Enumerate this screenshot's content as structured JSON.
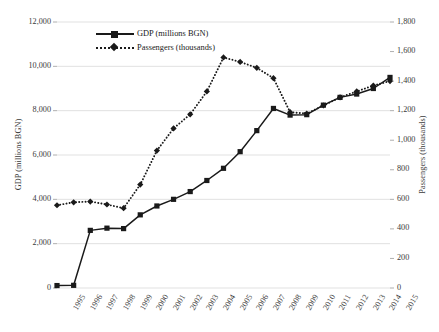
{
  "chart_data": {
    "type": "line",
    "title": "",
    "xlabel": "",
    "categories": [
      "1995",
      "1996",
      "1997",
      "1998",
      "1999",
      "2000",
      "2001",
      "2002",
      "2003",
      "2004",
      "2005",
      "2006",
      "2007",
      "2008",
      "2009",
      "2010",
      "2011",
      "2012",
      "2013",
      "2014",
      "2015"
    ],
    "grid": true,
    "legend_position": "top-center",
    "series": [
      {
        "name": "GDP (millions BGN)",
        "axis": "left",
        "marker": "square",
        "line_style": "solid",
        "color": "#1a1a1a",
        "values": [
          110,
          120,
          2600,
          2700,
          2680,
          3300,
          3700,
          4000,
          4350,
          4850,
          5400,
          6150,
          7100,
          8100,
          7800,
          7820,
          8250,
          8600,
          8750,
          9000,
          9500
        ]
      },
      {
        "name": "Passengers (thousands)",
        "axis": "right",
        "marker": "diamond",
        "line_style": "dotted",
        "color": "#1a1a1a",
        "values": [
          560,
          580,
          585,
          565,
          540,
          700,
          930,
          1080,
          1175,
          1330,
          1560,
          1530,
          1490,
          1420,
          1190,
          1180,
          1235,
          1290,
          1330,
          1370,
          1400
        ]
      }
    ],
    "y_left": {
      "label": "GDP (millions BGN)",
      "min": 0,
      "max": 12000,
      "step": 2000,
      "ticks": [
        "0",
        "2,000",
        "4,000",
        "6,000",
        "8,000",
        "10,000",
        "12,000"
      ]
    },
    "y_right": {
      "label": "Passengers (thousands)",
      "min": 0,
      "max": 1800,
      "step": 200,
      "ticks": [
        "0",
        "200",
        "400",
        "600",
        "800",
        "1,000",
        "1,200",
        "1,400",
        "1,600",
        "1,800"
      ]
    },
    "legend": [
      {
        "label": "GDP (millions BGN)",
        "marker": "square",
        "line_style": "solid"
      },
      {
        "label": "Passengers (thousands)",
        "marker": "diamond",
        "line_style": "dotted"
      }
    ]
  }
}
